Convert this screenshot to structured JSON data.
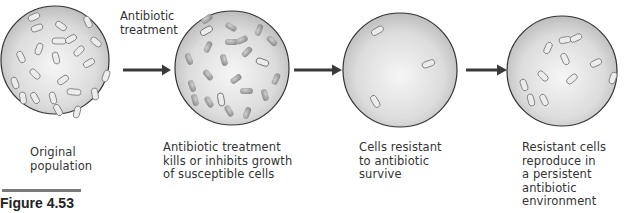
{
  "figure": {
    "label": "Figure 4.53"
  },
  "treatment_label": {
    "line1": "Antibiotic",
    "line2": "treatment"
  },
  "stages": [
    {
      "id": "original",
      "caption_lines": [
        "Original",
        "population"
      ]
    },
    {
      "id": "treatment",
      "caption_lines": [
        "Antibiotic treatment",
        "kills or inhibits growth",
        "of susceptible cells"
      ]
    },
    {
      "id": "survive",
      "caption_lines": [
        "Cells resistant",
        "to antibiotic",
        "survive"
      ]
    },
    {
      "id": "reproduce",
      "caption_lines": [
        "Resistant cells",
        "reproduce in",
        "a persistent",
        "antibiotic",
        "environment"
      ]
    }
  ],
  "colors": {
    "circle_fill_center": "#f4f4f4",
    "circle_fill_edge": "#c4c4c4",
    "circle_stroke": "#333333",
    "arrow": "#3a3a3a",
    "susceptible_cell": "#9a9a9a",
    "resistant_cell": "#e8e8e8"
  }
}
